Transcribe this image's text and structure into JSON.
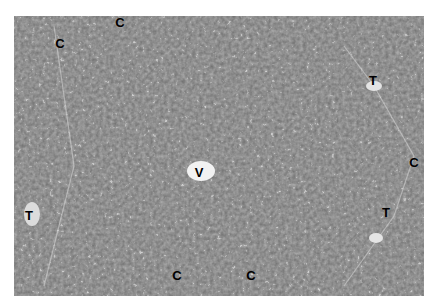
{
  "figure": {
    "background_color": "#6e6e6e",
    "labels": [
      {
        "text": "C",
        "x": 120,
        "y": 22
      },
      {
        "text": "C",
        "x": 60,
        "y": 43
      },
      {
        "text": "T",
        "x": 373,
        "y": 80
      },
      {
        "text": "V",
        "x": 199,
        "y": 172
      },
      {
        "text": "T",
        "x": 29,
        "y": 215
      },
      {
        "text": "C",
        "x": 414,
        "y": 162
      },
      {
        "text": "T",
        "x": 386,
        "y": 212
      },
      {
        "text": "C",
        "x": 177,
        "y": 275
      },
      {
        "text": "C",
        "x": 251,
        "y": 275
      }
    ]
  }
}
